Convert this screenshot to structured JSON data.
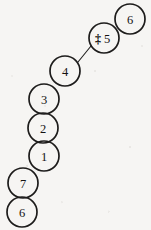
{
  "diagram": {
    "background_color": "#f6f5f3",
    "stroke_color": "#1d1c1b",
    "node_radius": 15,
    "nodes": [
      {
        "id": "node-6-top",
        "label": "6",
        "annotation": "",
        "cx": 130,
        "cy": 19,
        "r": 15
      },
      {
        "id": "node-5",
        "label": "5",
        "annotation": "‡",
        "cx": 104,
        "cy": 38,
        "r": 15
      },
      {
        "id": "node-4",
        "label": "4",
        "annotation": "",
        "cx": 65,
        "cy": 71,
        "r": 15
      },
      {
        "id": "node-3",
        "label": "3",
        "annotation": "",
        "cx": 44,
        "cy": 99,
        "r": 15
      },
      {
        "id": "node-2",
        "label": "2",
        "annotation": "",
        "cx": 43,
        "cy": 128,
        "r": 15
      },
      {
        "id": "node-1",
        "label": "1",
        "annotation": "",
        "cx": 44,
        "cy": 156,
        "r": 15
      },
      {
        "id": "node-7",
        "label": "7",
        "annotation": "",
        "cx": 23,
        "cy": 183,
        "r": 15
      },
      {
        "id": "node-6-bottom",
        "label": "6",
        "annotation": "",
        "cx": 22,
        "cy": 212,
        "r": 15
      }
    ],
    "edges": [
      {
        "id": "edge-4-to-5",
        "from": "node-4",
        "to": "node-5",
        "x1": 78,
        "y1": 62,
        "x2": 91,
        "y2": 46
      }
    ]
  }
}
